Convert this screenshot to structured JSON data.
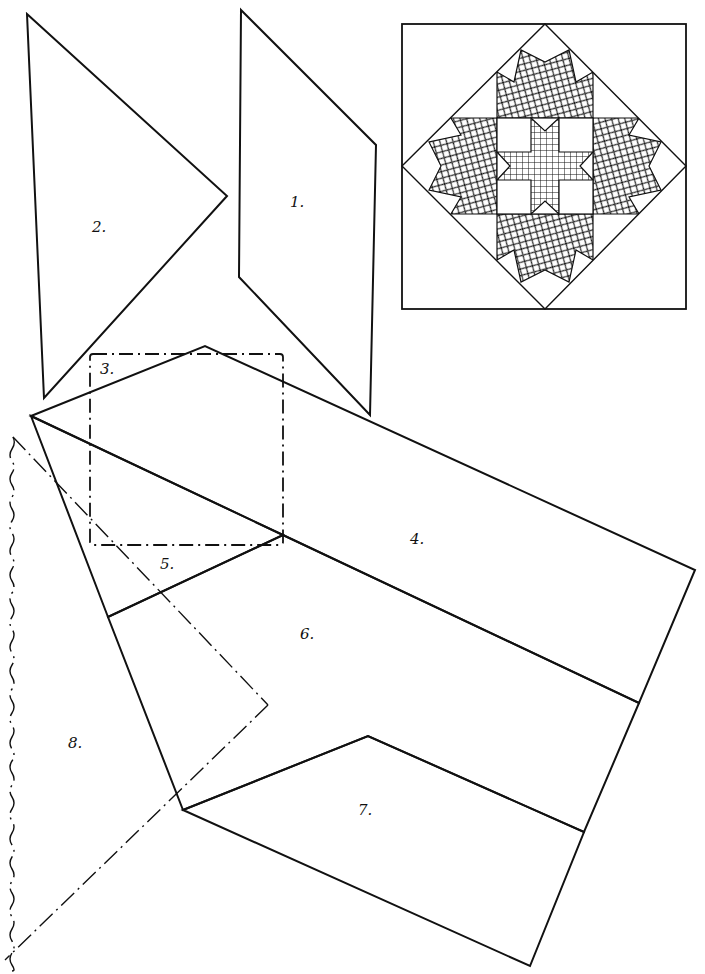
{
  "diagram": {
    "title": "",
    "pieces": [
      {
        "id": "1",
        "label": "1.",
        "shape": "parallelogram",
        "outline": "solid"
      },
      {
        "id": "2",
        "label": "2.",
        "shape": "kite-triangle",
        "outline": "solid"
      },
      {
        "id": "3",
        "label": "3.",
        "shape": "square",
        "outline": "dash-dot"
      },
      {
        "id": "4",
        "label": "4.",
        "shape": "trapezoid",
        "outline": "solid"
      },
      {
        "id": "5",
        "label": "5.",
        "shape": "triangle",
        "outline": "solid"
      },
      {
        "id": "6",
        "label": "6.",
        "shape": "trapezoid",
        "outline": "solid"
      },
      {
        "id": "7",
        "label": "7.",
        "shape": "trapezoid",
        "outline": "solid"
      },
      {
        "id": "8",
        "label": "8.",
        "shape": "large-triangle",
        "outline": "dash-dot-wavy"
      }
    ],
    "block_preview": {
      "description": "Finished quilt block: on-point star with sawtooth borders",
      "fills": {
        "outer": "crosshatch",
        "center_star": "grid"
      }
    },
    "colors": {
      "ink": "#111111",
      "paper": "#ffffff"
    }
  }
}
